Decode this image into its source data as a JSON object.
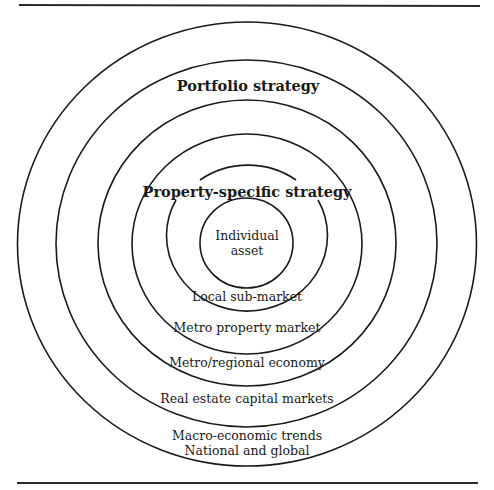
{
  "diagram": {
    "type": "concentric-circles",
    "center": {
      "x": 247,
      "y": 244
    },
    "strategies": {
      "portfolio": "Portfolio strategy",
      "property_specific": "Property-specific strategy"
    },
    "rings": [
      {
        "id": "individual-asset",
        "lines": [
          "Individual",
          "asset"
        ],
        "rx": 46.5,
        "ry": 45
      },
      {
        "id": "local-sub-market",
        "lines": [
          "Local sub-market"
        ],
        "rx": 80.5,
        "ry": 75.5
      },
      {
        "id": "metro-property-market",
        "lines": [
          "Metro property market"
        ],
        "rx": 115,
        "ry": 110
      },
      {
        "id": "metro-regional-economy",
        "lines": [
          "Metro/regional economy"
        ],
        "rx": 149,
        "ry": 143
      },
      {
        "id": "real-estate-capital-markets",
        "lines": [
          "Real estate capital markets"
        ],
        "rx": 190.5,
        "ry": 183.5
      },
      {
        "id": "macro-economic-trends",
        "lines": [
          "Macro-economic trends",
          "National and global"
        ],
        "rx": 229.5,
        "ry": 222
      }
    ],
    "colors": {
      "stroke": "#1a1a1a",
      "background": "#ffffff"
    }
  }
}
